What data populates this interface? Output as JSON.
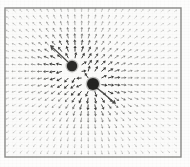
{
  "figure": {
    "caption": "",
    "background_color": "#fdfdfc",
    "frame": {
      "x": 5,
      "y": 8,
      "width": 176,
      "height": 149,
      "stroke_color": "#8a8a88",
      "stroke_width": 1.4,
      "fill_color": "#fbfbfa"
    }
  },
  "chart_data": {
    "type": "scatter",
    "subtitle": "",
    "xlabel": "",
    "ylabel": "",
    "grid": false,
    "legend_position": "none",
    "plot_area": {
      "x": 5,
      "y": 8,
      "width": 176,
      "height": 149
    },
    "field": {
      "kind": "vector-field",
      "description": "Arrow glyphs on a regular lattice pointing radially away from two point sources (outward / positive charges)",
      "grid_spacing_px": 6.6,
      "grid_origin": {
        "x": 9,
        "y": 12
      },
      "arrow_color": "#6b6b69",
      "arrow_max_length_px": 6.2,
      "arrow_min_length_px": 2.2,
      "falloff_exponent": 1.25
    },
    "sources": [
      {
        "name": "upper-left-charge",
        "label": "",
        "cx": 72,
        "cy": 66,
        "radius": 5.2,
        "charge": 1.0,
        "color": "#2a2a28"
      },
      {
        "name": "lower-right-charge",
        "label": "",
        "cx": 93,
        "cy": 84,
        "radius": 6.0,
        "charge": 1.25,
        "color": "#242422"
      }
    ],
    "highlight_arrows": [
      {
        "name": "upper-left-field-arrow",
        "x1": 68,
        "y1": 62,
        "x2": 50,
        "y2": 45,
        "color": "#4a4a48",
        "width": 1.2
      },
      {
        "name": "lower-right-field-arrow",
        "x1": 97,
        "y1": 88,
        "x2": 116,
        "y2": 104,
        "color": "#4a4a48",
        "width": 1.2
      }
    ]
  }
}
